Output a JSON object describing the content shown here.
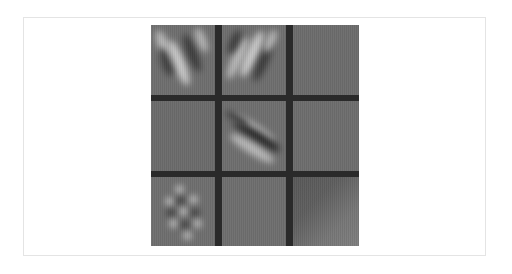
{
  "figure": {
    "rows": 3,
    "cols": 3,
    "colors": {
      "background": "#ffffff",
      "frame_border": "#e4e4e4",
      "grid_separator": "#2a2a2a",
      "tile_base": "#6e6e6e",
      "highlight": "#c0c0c0",
      "shadow": "#333333"
    },
    "tiles": [
      {
        "row": 0,
        "col": 0,
        "pattern": "diagonal light/dark stripes (V-shape, leaning left-down)"
      },
      {
        "row": 0,
        "col": 1,
        "pattern": "diagonal light/dark stripes (leaning right-up)"
      },
      {
        "row": 0,
        "col": 2,
        "pattern": "flat uniform gray"
      },
      {
        "row": 1,
        "col": 0,
        "pattern": "flat uniform gray"
      },
      {
        "row": 1,
        "col": 1,
        "pattern": "diagonal dark band with light sides (top-left to bottom-right)"
      },
      {
        "row": 1,
        "col": 2,
        "pattern": "flat uniform gray"
      },
      {
        "row": 2,
        "col": 0,
        "pattern": "checkerboard-like spotted diagonal texture"
      },
      {
        "row": 2,
        "col": 1,
        "pattern": "flat uniform gray"
      },
      {
        "row": 2,
        "col": 2,
        "pattern": "smooth gradient, darker upper-left to lighter lower-right"
      }
    ]
  }
}
